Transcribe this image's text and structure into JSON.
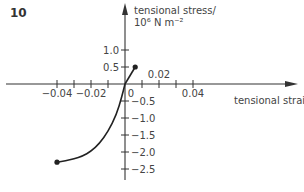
{
  "figure_number": "10",
  "chart_data": {
    "type": "line",
    "title": "",
    "xlabel": "tensional strain",
    "ylabel_line1": "tensional stress/",
    "ylabel_line2": "10⁶ N m⁻²",
    "x_ticks": [
      -0.04,
      -0.03,
      -0.02,
      -0.01,
      0,
      0.01,
      0.02,
      0.03,
      0.04
    ],
    "x_tick_labels": [
      {
        "value": -0.04,
        "label": "−0.04"
      },
      {
        "value": -0.02,
        "label": "−0.02"
      },
      {
        "value": 0,
        "label": "0"
      },
      {
        "value": 0.02,
        "label": "0.02"
      },
      {
        "value": 0.04,
        "label": "0.04"
      }
    ],
    "y_ticks": [
      1.0,
      0.5,
      -0.5,
      -1.0,
      -1.5,
      -2.0,
      -2.5
    ],
    "y_tick_labels": [
      {
        "value": 1.0,
        "label": "1.0"
      },
      {
        "value": 0.5,
        "label": "0.5"
      },
      {
        "value": -0.5,
        "label": "−0.5"
      },
      {
        "value": -1.0,
        "label": "−1.0"
      },
      {
        "value": -1.5,
        "label": "−1.5"
      },
      {
        "value": -2.0,
        "label": "−2.0"
      },
      {
        "value": -2.5,
        "label": "−2.5"
      }
    ],
    "xlim": [
      -0.07,
      0.1
    ],
    "ylim": [
      -2.9,
      2.4
    ],
    "grid": false,
    "series": [
      {
        "name": "tension (linear)",
        "x": [
          0,
          0.006
        ],
        "y": [
          0,
          0.5
        ],
        "end_marker": "dot"
      },
      {
        "name": "compression (curve)",
        "x": [
          0,
          -0.002,
          -0.005,
          -0.01,
          -0.015,
          -0.02,
          -0.025,
          -0.03,
          -0.035,
          -0.04
        ],
        "y": [
          0,
          -0.4,
          -0.9,
          -1.4,
          -1.75,
          -1.98,
          -2.12,
          -2.2,
          -2.26,
          -2.3
        ],
        "end_marker": "dot"
      }
    ]
  }
}
